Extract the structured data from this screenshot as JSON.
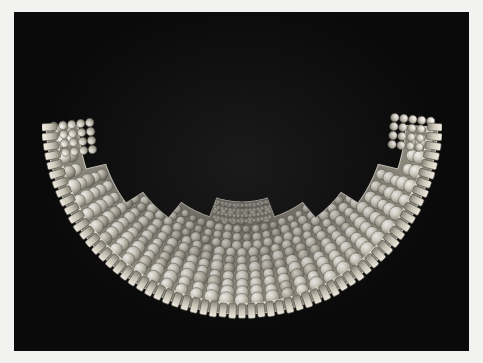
{
  "image": {
    "subject": "Beaded shell collar ornament",
    "description": "Black-and-white photograph of a crescent shaped beaded collar made of many small white disc beads arranged in concentric rows, with a stepped notch pattern along the inner upper edge and a fringe of rectangular tabs along the outer rim",
    "orientation": "landscape",
    "background_color": "#0a0a0a",
    "mat_color": "#f2f2f0",
    "object_tone": "#d8d4c8",
    "shadow_tone": "#6b675e",
    "width": 483,
    "height": 363
  },
  "photo": {
    "field": {
      "x": 14,
      "y": 12,
      "width": 455,
      "height": 339
    },
    "caption": "",
    "credit": ""
  },
  "artifact": {
    "name": "beaded-collar",
    "form": "crescent",
    "outer_radius": 196,
    "inner_radius": 84,
    "center_x": 200,
    "center_y": 92,
    "bead_rows": 13,
    "tab_count": 62,
    "notch_steps": 4,
    "bead_color": "#e4e0d4",
    "bead_shadow": "#7a776d",
    "tab_color": "#cfcabb",
    "rim_color": "#f0ece0"
  },
  "meta": {
    "alt_text": "Photograph of a wide crescent-shaped collar composed of hundreds of small round shell beads in concentric arcs, bordered by rectangular tabs."
  }
}
